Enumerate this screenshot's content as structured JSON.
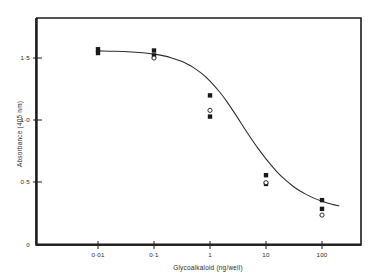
{
  "chart_data": {
    "type": "scatter",
    "title": "",
    "subtitle": "",
    "xlabel": "Glycoalkaloid  (ng/well)",
    "ylabel": "Absorbance  (405 nm)",
    "xscale": "log",
    "xlim": [
      0.003,
      300
    ],
    "ylim": [
      0,
      1.75
    ],
    "grid": false,
    "legend": null,
    "x_tick_labels": [
      "0·01",
      "0·1",
      "1",
      "10",
      "100"
    ],
    "x_tick_values": [
      0.01,
      0.1,
      1,
      10,
      100
    ],
    "y_tick_labels": [
      "0",
      "0·5",
      "1·0",
      "1·5"
    ],
    "y_tick_values": [
      0,
      0.5,
      1.0,
      1.5
    ],
    "series": [
      {
        "name": "replicate-squares",
        "marker": "filled-square",
        "points": [
          {
            "x": 0.01,
            "y": 1.57
          },
          {
            "x": 0.01,
            "y": 1.54
          },
          {
            "x": 0.1,
            "y": 1.56
          },
          {
            "x": 0.1,
            "y": 1.52
          },
          {
            "x": 1,
            "y": 1.2
          },
          {
            "x": 1,
            "y": 1.03
          },
          {
            "x": 10,
            "y": 0.56
          },
          {
            "x": 10,
            "y": 0.49
          },
          {
            "x": 100,
            "y": 0.36
          },
          {
            "x": 100,
            "y": 0.29
          }
        ]
      },
      {
        "name": "replicate-open-circles",
        "marker": "open-circle",
        "points": [
          {
            "x": 0.1,
            "y": 1.5
          },
          {
            "x": 1,
            "y": 1.08
          },
          {
            "x": 10,
            "y": 0.5
          },
          {
            "x": 100,
            "y": 0.24
          }
        ]
      }
    ],
    "fitted_curve": {
      "name": "sigmoid-fit",
      "model": "four-parameter-logistic",
      "top": 1.56,
      "bottom": 0.2,
      "ic50": 2.0,
      "hill_slope": 1.05,
      "points": [
        {
          "x": 0.01,
          "y": 1.557
        },
        {
          "x": 0.02,
          "y": 1.554
        },
        {
          "x": 0.04,
          "y": 1.548
        },
        {
          "x": 0.07,
          "y": 1.54
        },
        {
          "x": 0.1,
          "y": 1.531
        },
        {
          "x": 0.15,
          "y": 1.517
        },
        {
          "x": 0.2,
          "y": 1.503
        },
        {
          "x": 0.3,
          "y": 1.476
        },
        {
          "x": 0.4,
          "y": 1.45
        },
        {
          "x": 0.5,
          "y": 1.425
        },
        {
          "x": 0.7,
          "y": 1.378
        },
        {
          "x": 1.0,
          "y": 1.315
        },
        {
          "x": 1.5,
          "y": 1.225
        },
        {
          "x": 2.0,
          "y": 1.15
        },
        {
          "x": 3.0,
          "y": 1.032
        },
        {
          "x": 4.0,
          "y": 0.944
        },
        {
          "x": 5.0,
          "y": 0.878
        },
        {
          "x": 7.0,
          "y": 0.783
        },
        {
          "x": 10.0,
          "y": 0.691
        },
        {
          "x": 15.0,
          "y": 0.597
        },
        {
          "x": 20.0,
          "y": 0.54
        },
        {
          "x": 30.0,
          "y": 0.473
        },
        {
          "x": 40.0,
          "y": 0.435
        },
        {
          "x": 50.0,
          "y": 0.41
        },
        {
          "x": 70.0,
          "y": 0.378
        },
        {
          "x": 100.0,
          "y": 0.351
        },
        {
          "x": 150.0,
          "y": 0.327
        },
        {
          "x": 200.0,
          "y": 0.314
        }
      ]
    }
  },
  "figure": {
    "caption": ""
  }
}
